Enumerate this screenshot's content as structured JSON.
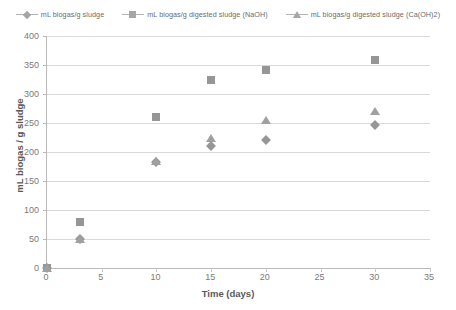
{
  "chart_data": {
    "type": "scatter",
    "title": "",
    "xlabel": "Time (days)",
    "ylabel": "mL biogas / g sludge",
    "xlim": [
      0,
      35
    ],
    "ylim": [
      0,
      400
    ],
    "xticks": [
      0,
      5,
      10,
      15,
      20,
      25,
      30,
      35
    ],
    "yticks": [
      0,
      50,
      100,
      150,
      200,
      250,
      300,
      350,
      400
    ],
    "grid": "horizontal",
    "legend_position": "top-center",
    "x": [
      0,
      3,
      10,
      15,
      20,
      30
    ],
    "series": [
      {
        "name": "mL biogas/g sludge",
        "marker": "diamond",
        "color": "#969696",
        "values": [
          0,
          50,
          183,
          211,
          220,
          247
        ]
      },
      {
        "name": "mL biogas/g digested sludge (NaOH)",
        "marker": "square",
        "color": "#969696",
        "values": [
          0,
          80,
          260,
          325,
          341,
          358
        ]
      },
      {
        "name": "mL biogas/g digested sludge (Ca(OH)2)",
        "marker": "triangle",
        "color": "#a0a0a0",
        "values": [
          0,
          50,
          184,
          225,
          256,
          270
        ]
      }
    ]
  }
}
